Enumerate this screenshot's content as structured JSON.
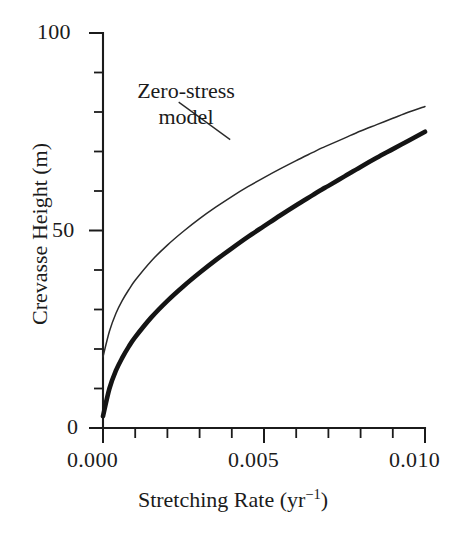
{
  "chart_data": {
    "type": "line",
    "title": "",
    "xlabel": "Stretching Rate (yr⁻¹)",
    "xlabel_base": "Stretching Rate (yr",
    "xlabel_sup": "−1",
    "xlabel_tail": ")",
    "ylabel": "Crevasse Height (m)",
    "xlim": [
      0.0,
      0.01
    ],
    "ylim": [
      0,
      100
    ],
    "grid": false,
    "legend": "none",
    "x_ticks_major": [
      0.0,
      0.005,
      0.01
    ],
    "x_tick_labels": [
      "0.000",
      "0.005",
      "0.010"
    ],
    "x_ticks_minor": [
      0.001,
      0.002,
      0.003,
      0.004,
      0.006,
      0.007,
      0.008,
      0.009
    ],
    "y_ticks_major": [
      0,
      50,
      100
    ],
    "y_tick_labels": [
      "0",
      "50",
      "100"
    ],
    "y_ticks_minor": [
      10,
      20,
      30,
      40,
      60,
      70,
      80,
      90
    ],
    "annotations": [
      {
        "name": "zero-stress-model",
        "text_line_1": "Zero-stress",
        "text_line_2": "model",
        "points_to_series": "Zero-stress model",
        "leader_from": [
          0.00235,
          82.5
        ],
        "leader_to": [
          0.00395,
          73.0
        ]
      }
    ],
    "x": [
      0.0,
      0.0002,
      0.0004,
      0.0006,
      0.0008,
      0.001,
      0.0015,
      0.002,
      0.0025,
      0.003,
      0.0035,
      0.004,
      0.0045,
      0.005,
      0.0055,
      0.006,
      0.0065,
      0.0068,
      0.007,
      0.0075,
      0.008,
      0.0085,
      0.009,
      0.0095,
      0.01
    ],
    "series": [
      {
        "name": "Zero-stress model",
        "style": "thin",
        "color": "#2a2a2a",
        "values": [
          18.0,
          24.5,
          29.0,
          32.3,
          35.0,
          37.4,
          42.3,
          46.3,
          49.8,
          53.0,
          55.9,
          58.6,
          61.1,
          63.4,
          65.6,
          67.7,
          69.7,
          70.9,
          71.6,
          73.4,
          75.2,
          76.8,
          78.4,
          80.0,
          81.4
        ],
        "value_at_x_max": 81.4,
        "value_at_x_min": 18.0
      },
      {
        "name": "Full-stress model",
        "style": "thick",
        "color": "#141414",
        "values": [
          3.0,
          10.0,
          14.5,
          17.8,
          20.6,
          23.0,
          28.0,
          32.2,
          35.9,
          39.3,
          42.5,
          45.5,
          48.4,
          51.1,
          53.8,
          56.4,
          58.9,
          60.4,
          61.3,
          63.7,
          66.1,
          68.4,
          70.6,
          72.8,
          75.0
        ],
        "value_at_x_max": 75.0,
        "value_at_x_min": 3.0
      }
    ],
    "crossover_point": [
      0.0068,
      70.9
    ]
  },
  "axes": {
    "y_labels": {
      "top": "100",
      "mid": "50",
      "bottom": "0"
    },
    "x_labels": {
      "left": "0.000",
      "mid": "0.005",
      "right": "0.010"
    },
    "y_title": "Crevasse Height (m)",
    "x_title_base": "Stretching Rate (yr",
    "x_title_sup": "−1",
    "x_title_tail": ")"
  },
  "annotation": {
    "line1": "Zero-stress",
    "line2": "model"
  },
  "colors": {
    "background": "#ffffff",
    "ink": "#1b1b1b",
    "thick_curve": "#141414",
    "thin_curve": "#2a2a2a"
  }
}
